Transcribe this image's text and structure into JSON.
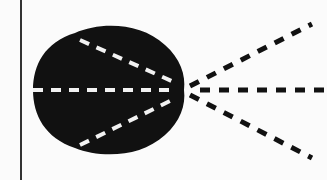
{
  "diagram": {
    "type": "optical-ray-diagram",
    "colors": {
      "background": "#fbfbfb",
      "body": "#111111",
      "internal_rays": "#f2f2f2",
      "external_rays": "#111111",
      "axis_line": "#333333"
    },
    "elements": {
      "axis_line": {
        "x": 21,
        "y1": 0,
        "y2": 180
      },
      "focal_point": {
        "x": 183,
        "y": 90
      },
      "internal_rays": [
        {
          "from": [
            80,
            40
          ],
          "to": [
            176,
            83
          ]
        },
        {
          "from": [
            33,
            90
          ],
          "to": [
            176,
            90
          ]
        },
        {
          "from": [
            80,
            145
          ],
          "to": [
            176,
            98
          ]
        }
      ],
      "external_rays": [
        {
          "from": [
            190,
            86
          ],
          "to": [
            312,
            24
          ]
        },
        {
          "from": [
            200,
            90
          ],
          "to": [
            324,
            90
          ]
        },
        {
          "from": [
            190,
            95
          ],
          "to": [
            312,
            158
          ]
        }
      ]
    }
  }
}
